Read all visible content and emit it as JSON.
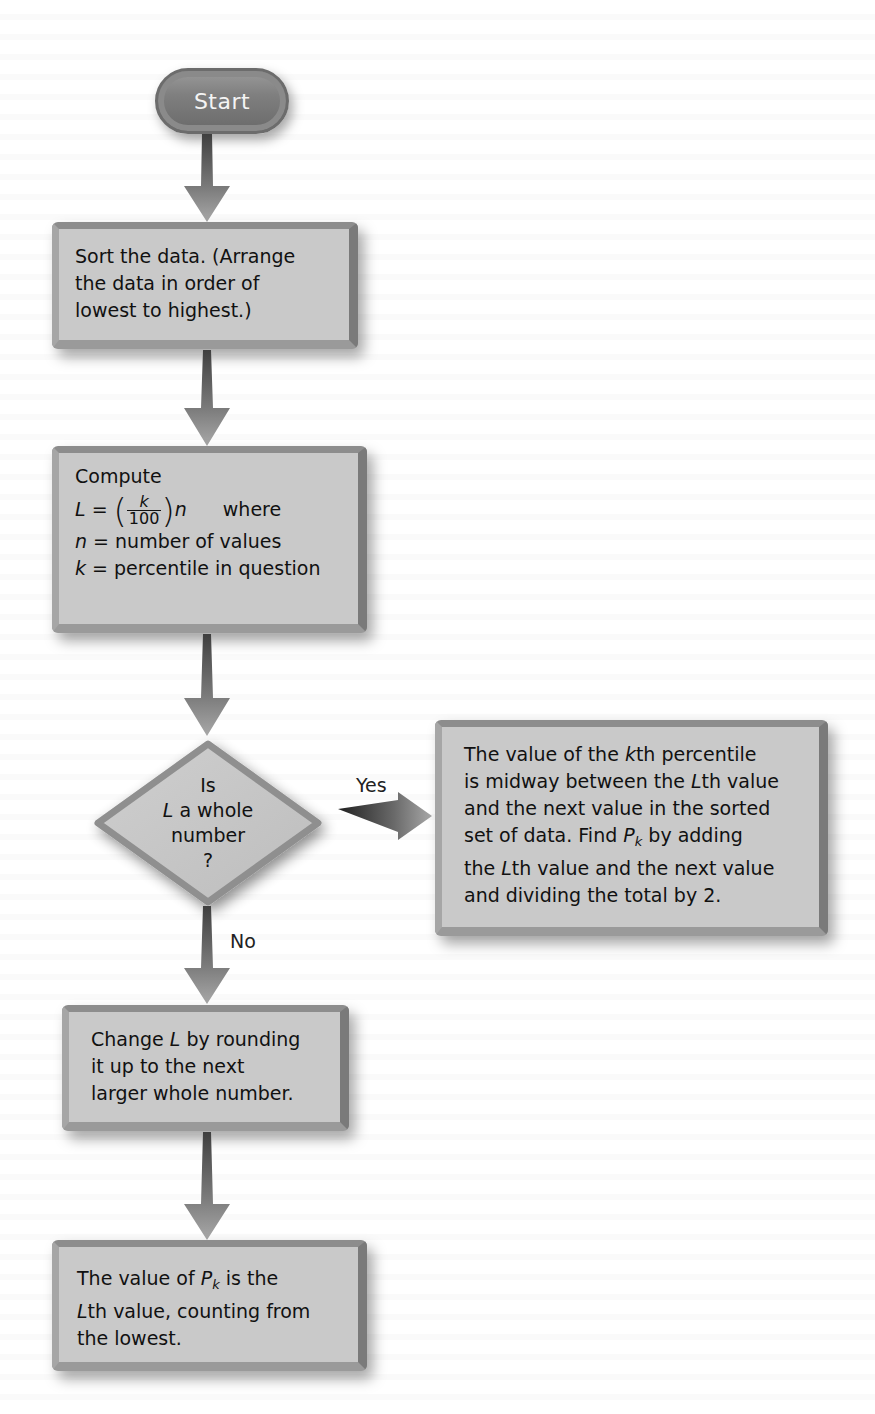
{
  "flowchart": {
    "start": {
      "label": "Start"
    },
    "step_sort": {
      "lines": [
        "Sort the data. (Arrange",
        "the data in order of",
        "lowest to highest.)"
      ]
    },
    "step_compute": {
      "title": "Compute",
      "formula_lhs": "L =",
      "formula_num": "k",
      "formula_den": "100",
      "formula_var": "n",
      "formula_where": "where",
      "def_n_var": "n",
      "def_n_text": "= number of values",
      "def_k_var": "k",
      "def_k_text": "= percentile in question"
    },
    "decision": {
      "line1": "Is",
      "line2_var": "L",
      "line2_text": " a whole",
      "line3": "number",
      "line4": "?"
    },
    "branch_labels": {
      "yes": "Yes",
      "no": "No"
    },
    "step_yes": {
      "l1a": "The value of the ",
      "l1b": "k",
      "l1c": "th percentile",
      "l2a": "is midway between the ",
      "l2b": "L",
      "l2c": "th value",
      "l3": "and the next value in the sorted",
      "l4a": "set of data. Find ",
      "l4b": "P",
      "l4sub": "k",
      "l4c": " by adding",
      "l5a": "the ",
      "l5b": "L",
      "l5c": "th value and the next value",
      "l6": "and dividing the total by 2."
    },
    "step_no": {
      "l1a": "Change ",
      "l1b": "L",
      "l1c": " by rounding",
      "l2": "it up to the next",
      "l3": "larger whole number."
    },
    "step_final": {
      "l1a": "The value of ",
      "l1b": "P",
      "l1sub": "k",
      "l1c": " is the",
      "l2a": "L",
      "l2b": "th value, counting from",
      "l3": "the lowest."
    }
  },
  "colors": {
    "box_fill": "#c9c9c9",
    "box_border": "#8d8d8d",
    "arrow_dark": "#555555",
    "arrow_light": "#9a9a9a",
    "start_fill": "#7f7f7f"
  }
}
